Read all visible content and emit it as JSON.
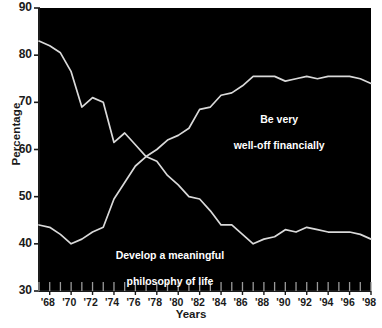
{
  "chart_data": {
    "type": "line",
    "title": "",
    "xlabel": "Years",
    "ylabel": "Percentage",
    "xlim": [
      1967,
      1998
    ],
    "ylim": [
      30,
      90
    ],
    "grid": false,
    "legend_position": "inline-annotations",
    "y_ticks": [
      30,
      40,
      50,
      60,
      70,
      80,
      90
    ],
    "y_tick_labels": [
      "30",
      "40",
      "50",
      "60",
      "70",
      "80",
      "90"
    ],
    "x_tick_labels": [
      "'68",
      "'70",
      "'72",
      "'74",
      "'76",
      "'78",
      "'80",
      "'82",
      "'84",
      "'86",
      "'88",
      "'90",
      "'92",
      "'94",
      "'96",
      "'98"
    ],
    "x_tick_years": [
      1968,
      1970,
      1972,
      1974,
      1976,
      1978,
      1980,
      1982,
      1984,
      1986,
      1988,
      1990,
      1992,
      1994,
      1996,
      1998
    ],
    "x_minor_years": [
      1967,
      1968,
      1969,
      1970,
      1971,
      1972,
      1973,
      1974,
      1975,
      1976,
      1977,
      1978,
      1979,
      1980,
      1981,
      1982,
      1983,
      1984,
      1985,
      1986,
      1987,
      1988,
      1989,
      1990,
      1991,
      1992,
      1993,
      1994,
      1995,
      1996,
      1997,
      1998
    ],
    "x": [
      1967,
      1968,
      1969,
      1970,
      1971,
      1972,
      1973,
      1974,
      1975,
      1976,
      1977,
      1978,
      1979,
      1980,
      1981,
      1982,
      1983,
      1984,
      1985,
      1986,
      1987,
      1988,
      1989,
      1990,
      1991,
      1992,
      1993,
      1994,
      1995,
      1996,
      1997,
      1998
    ],
    "series": [
      {
        "name": "Develop a meaningful philosophy of life",
        "annotation": "Develop a meaningful\nphilosophy of life",
        "color": "#d9d9d9",
        "values": [
          83.0,
          82.0,
          80.5,
          76.5,
          69.0,
          71.0,
          70.0,
          61.5,
          63.5,
          61.0,
          58.5,
          57.5,
          54.5,
          52.5,
          50.0,
          49.5,
          47.0,
          44.0,
          44.0,
          42.0,
          40.0,
          41.0,
          41.5,
          43.0,
          42.5,
          43.5,
          43.0,
          42.5,
          42.5,
          42.5,
          42.0,
          41.0
        ]
      },
      {
        "name": "Be very well-off financially",
        "annotation": "Be very\nwell-off financially",
        "color": "#d9d9d9",
        "values": [
          44.0,
          43.5,
          42.0,
          40.0,
          41.0,
          42.5,
          43.5,
          49.5,
          53.0,
          56.5,
          58.5,
          60.0,
          62.0,
          63.0,
          64.5,
          68.5,
          69.0,
          71.5,
          72.0,
          73.5,
          75.5,
          75.5,
          75.5,
          74.5,
          75.0,
          75.5,
          75.0,
          75.5,
          75.5,
          75.5,
          75.0,
          74.0
        ]
      }
    ]
  },
  "axis": {
    "ylabel": "Percentage",
    "xlabel": "Years"
  },
  "annotations": {
    "wealth_line1": "Be very",
    "wealth_line2": "well-off financially",
    "philosophy_line1": "Develop a meaningful",
    "philosophy_line2": "philosophy of life"
  },
  "colors": {
    "plot_background": "#000000",
    "page_background": "#ffffff",
    "line": "#d9d9d9",
    "text": "#1a1a1a",
    "annotation_text": "#ffffff"
  }
}
